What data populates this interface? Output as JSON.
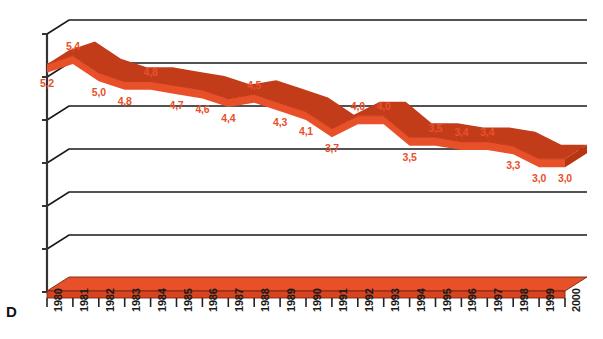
{
  "chart_data": {
    "type": "line",
    "title": "",
    "subtitle": "",
    "xlabel": "",
    "ylabel": "",
    "corner_label": "D",
    "grid": true,
    "legend": "none",
    "style": "3d-ribbon",
    "ylim": [
      0,
      6
    ],
    "ytick_labels": [
      "0",
      "1,0",
      "2,0",
      "3,0",
      "4,0",
      "5,0",
      "6,0"
    ],
    "ytick_values": [
      0,
      1,
      2,
      3,
      4,
      5,
      6
    ],
    "categories": [
      "1980",
      "1981",
      "1982",
      "1983",
      "1984",
      "1985",
      "1986",
      "1987",
      "1988",
      "1989",
      "1990",
      "1991",
      "1992",
      "1993",
      "1994",
      "1995",
      "1996",
      "1997",
      "1998",
      "1999",
      "2000"
    ],
    "values": [
      5.2,
      5.4,
      5.0,
      4.8,
      4.8,
      4.7,
      4.6,
      4.4,
      4.5,
      4.3,
      4.1,
      3.7,
      4.0,
      4.0,
      3.5,
      3.5,
      3.4,
      3.4,
      3.3,
      3.0,
      3.0
    ],
    "data_labels": [
      "5,2",
      "5,4",
      "5,0",
      "4,8",
      "4,8",
      "4,7",
      "4,6",
      "4,4",
      "4,5",
      "4,3",
      "4,1",
      "3,7",
      "4,0",
      "4,0",
      "3,5",
      "3,5",
      "3,4",
      "3,4",
      "3,3",
      "3,0",
      "3,0"
    ],
    "series": [
      {
        "name": "series-1",
        "values": [
          5.2,
          5.4,
          5.0,
          4.8,
          4.8,
          4.7,
          4.6,
          4.4,
          4.5,
          4.3,
          4.1,
          3.7,
          4.0,
          4.0,
          3.5,
          3.5,
          3.4,
          3.4,
          3.3,
          3.0,
          3.0
        ]
      }
    ]
  },
  "colors": {
    "ribbon_face": "#E8502A",
    "ribbon_top": "#D8441F",
    "ribbon_side": "#C23C1A",
    "grid": "#1a1a1a",
    "axis": "#333333",
    "label": "#E8502A",
    "tick_text": "#1a1a1a",
    "background": "#ffffff"
  }
}
